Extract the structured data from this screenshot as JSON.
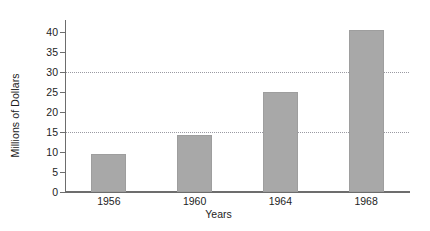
{
  "chart_data": {
    "type": "bar",
    "title": "",
    "subtitle": "",
    "xlabel": "Years",
    "ylabel": "Millions of Dollars",
    "categories": [
      "1956",
      "1960",
      "1964",
      "1968"
    ],
    "values": [
      9.5,
      14.3,
      25.0,
      40.5
    ],
    "series": [
      {
        "name": "Millions of Dollars",
        "values": [
          9.5,
          14.3,
          25.0,
          40.5
        ]
      }
    ],
    "ylim": [
      0,
      42
    ],
    "xlim": [
      0,
      4
    ],
    "y_ticks": [
      0,
      5,
      10,
      15,
      20,
      25,
      30,
      35,
      40
    ],
    "y_tick_labels": [
      "0",
      "5",
      "10",
      "15",
      "20",
      "25",
      "30",
      "35",
      "40"
    ],
    "gridlines": {
      "horizontal_values": [
        15,
        30
      ],
      "style": "dotted",
      "color": "#9a9aa2",
      "vertical": false
    },
    "grid": true,
    "legend": null,
    "legend_position": "none",
    "annotations": [],
    "colors": {
      "bar_fill": "#a8a8a8",
      "bar_edge": "#9e9e9e",
      "axis": "#6d6d6d",
      "text": "#1d1d1d",
      "grid": "#9a9aa2",
      "background": "#ffffff"
    },
    "bar_width_fraction": 0.41
  }
}
